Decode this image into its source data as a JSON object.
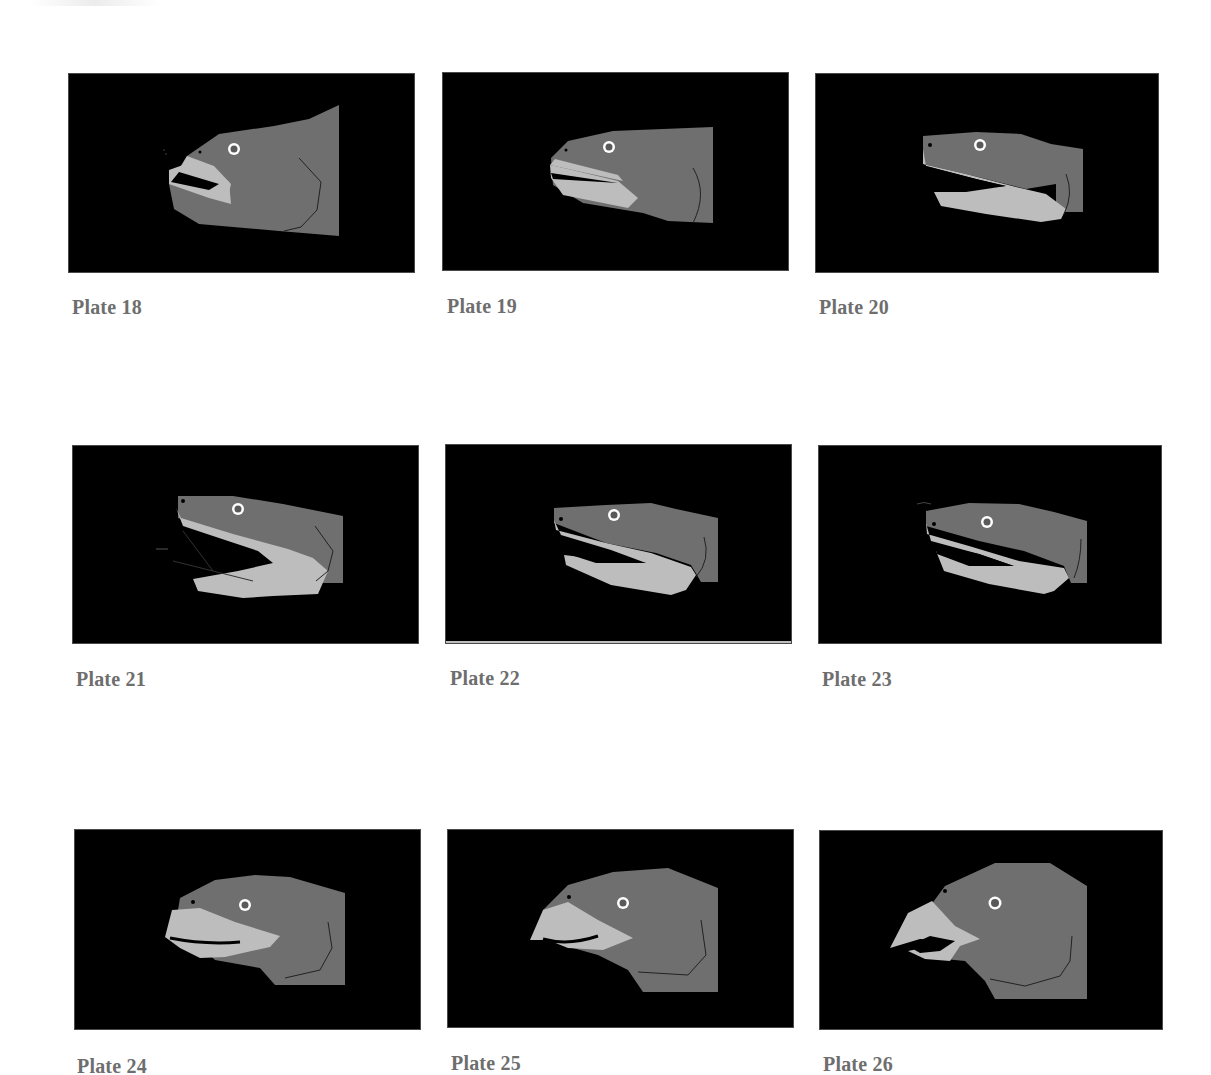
{
  "page": {
    "background": "#ffffff",
    "caption_color": "#6e6e6e",
    "frame_color": "#000000",
    "head_color": "#6f6f6f",
    "jaw_color": "#bdbdbd",
    "eye_ring_color": "#ffffff"
  },
  "plates": [
    {
      "label": "Plate 18",
      "subject": "fish-head-mouth-slightly-open"
    },
    {
      "label": "Plate 19",
      "subject": "fish-head-mouth-slightly-open"
    },
    {
      "label": "Plate 20",
      "subject": "eel-head-mouth-open"
    },
    {
      "label": "Plate 21",
      "subject": "eel-head-mouth-wide-open"
    },
    {
      "label": "Plate 22",
      "subject": "eel-head-mouth-open"
    },
    {
      "label": "Plate 23",
      "subject": "eel-head-mouth-open"
    },
    {
      "label": "Plate 24",
      "subject": "head-beak-forming"
    },
    {
      "label": "Plate 25",
      "subject": "bird-like-head-beak"
    },
    {
      "label": "Plate 26",
      "subject": "bird-head-hooked-beak-open"
    }
  ]
}
